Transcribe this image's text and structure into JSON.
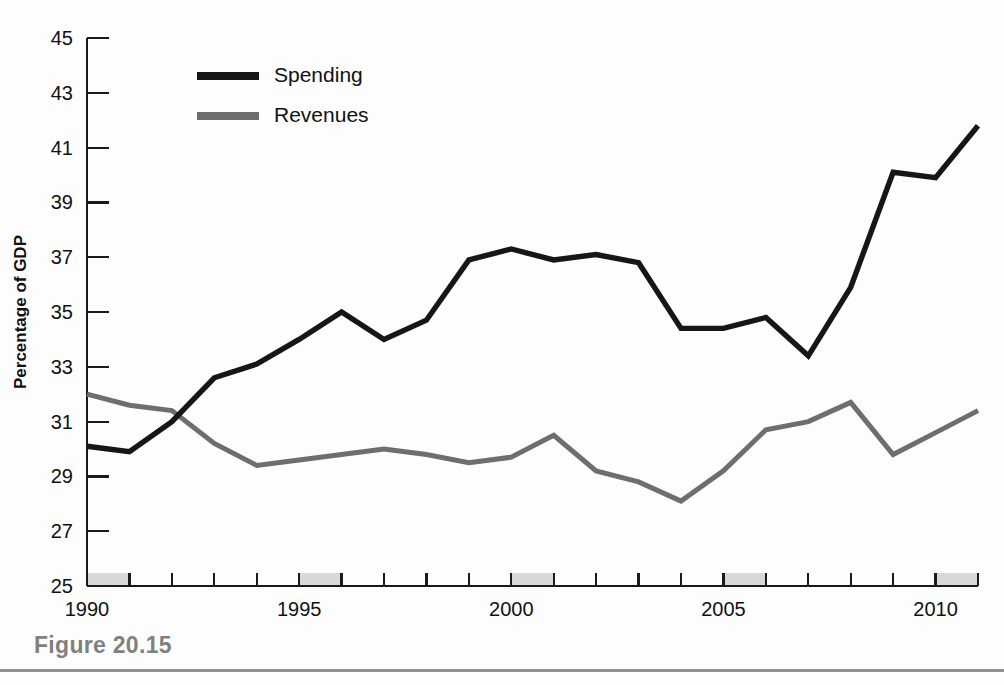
{
  "figure": {
    "caption_label": "Figure 20.15"
  },
  "chart_data": {
    "type": "line",
    "title": "",
    "subtitle": "",
    "xlabel": "",
    "ylabel": "Percentage of GDP",
    "xlim": [
      1990,
      2011
    ],
    "ylim": [
      25,
      45
    ],
    "grid": false,
    "legend_position": "top-left-inside",
    "x": [
      1990,
      1991,
      1992,
      1993,
      1994,
      1995,
      1996,
      1997,
      1998,
      1999,
      2000,
      2001,
      2002,
      2003,
      2004,
      2005,
      2006,
      2007,
      2008,
      2009,
      2010,
      2011
    ],
    "xticks": [
      1990,
      1995,
      2000,
      2005,
      2010
    ],
    "xtick_labels": [
      "1990",
      "1995",
      "2000",
      "2005",
      "2010"
    ],
    "xtick_minor_step": 1,
    "yticks": [
      25,
      27,
      29,
      31,
      33,
      35,
      37,
      39,
      41,
      43,
      45
    ],
    "ytick_labels": [
      "25",
      "27",
      "29",
      "31",
      "33",
      "35",
      "37",
      "39",
      "41",
      "43",
      "45"
    ],
    "series": [
      {
        "name": "Spending",
        "color": "#161616",
        "values": [
          30.1,
          29.9,
          31.0,
          32.6,
          33.1,
          34.0,
          35.0,
          34.0,
          34.7,
          36.9,
          37.3,
          36.9,
          37.1,
          36.8,
          34.4,
          34.4,
          34.8,
          33.4,
          35.9,
          40.1,
          39.9,
          41.8
        ]
      },
      {
        "name": "Revenues",
        "color": "#6e6e6e",
        "values": [
          32.0,
          31.6,
          31.4,
          30.2,
          29.4,
          29.6,
          29.8,
          30.0,
          29.8,
          29.5,
          29.7,
          30.5,
          29.2,
          28.8,
          28.1,
          29.2,
          30.7,
          31.0,
          31.7,
          29.8,
          30.6,
          31.4
        ]
      }
    ],
    "shaded_bands": [
      {
        "label": "recession-band-1990",
        "start": 1990,
        "end": 1991
      },
      {
        "label": "recession-band-1995",
        "start": 1995,
        "end": 1996
      },
      {
        "label": "recession-band-2000",
        "start": 2000,
        "end": 2001
      },
      {
        "label": "recession-band-2005",
        "start": 2005,
        "end": 2006
      },
      {
        "label": "recession-band-2010",
        "start": 2010,
        "end": 2011
      }
    ],
    "legend": [
      "Spending",
      "Revenues"
    ]
  }
}
